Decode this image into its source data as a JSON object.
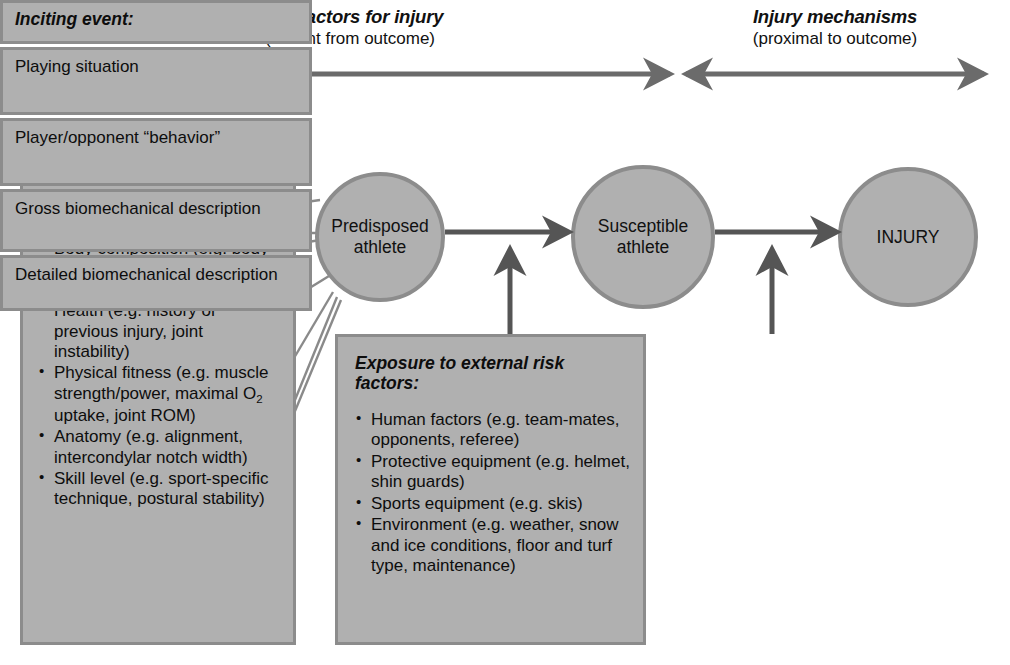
{
  "header": {
    "left": {
      "title": "Risk factors for injury",
      "subtitle": "(distant from outcome)"
    },
    "right": {
      "title": "Injury mechanisms",
      "subtitle": "(proximal to outcome)"
    }
  },
  "nodes": {
    "predisposed": {
      "line1": "Predisposed",
      "line2": "athlete"
    },
    "susceptible": {
      "line1": "Susceptible",
      "line2": "athlete"
    },
    "injury": {
      "line1": "INJURY",
      "line2": ""
    }
  },
  "internal_panel": {
    "title": "Internal risk factors:",
    "items": [
      "Age (maturation, aging)",
      "Gender",
      "Body composition (e.g. body weight, fat mass, BMI, anthropometry)",
      "Health (e.g. history of previous injury, joint instability)",
      "Physical fitness (e.g. muscle strength/power, maximal O₂ uptake, joint ROM)",
      "Anatomy (e.g. alignment, intercondylar notch width)",
      "Skill level (e.g. sport-specific technique, postural stability)"
    ]
  },
  "exposure_panel": {
    "title": "Exposure to external risk factors:",
    "items": [
      "Human factors (e.g. team-mates, opponents, referee)",
      "Protective equipment (e.g. helmet, shin guards)",
      "Sports equipment (e.g. skis)",
      "Environment (e.g. weather, snow and ice conditions, floor and turf type, maintenance)"
    ]
  },
  "inciting_panel": {
    "title": "Inciting event:",
    "rows": [
      "Playing situation",
      "Player/opponent “behavior”",
      "Gross biomechanical description",
      "Detailed biomechanical description"
    ]
  },
  "colors": {
    "fill": "#b0b0b0",
    "stroke": "#8c8c8c",
    "arrow": "#6b6b6b",
    "text": "#0d0d0d",
    "background": "#ffffff"
  }
}
